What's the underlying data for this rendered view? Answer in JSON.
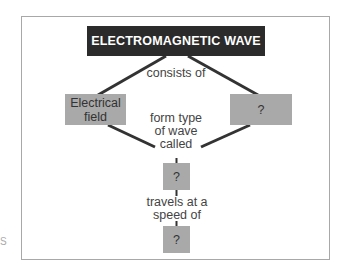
{
  "diagram": {
    "title": "ELECTROMAGNETIC WAVE",
    "nodes": {
      "left": "Electrical field",
      "right": "?",
      "middle": "?",
      "bottom": "?"
    },
    "links": {
      "consists_of": "consists of",
      "form": "form type of wave called",
      "travels": "travels at a speed of"
    },
    "edge_fragment": "S"
  },
  "colors": {
    "header_bg": "#2b2b2b",
    "node_bg": "#a9a9a9",
    "line": "#333333"
  }
}
